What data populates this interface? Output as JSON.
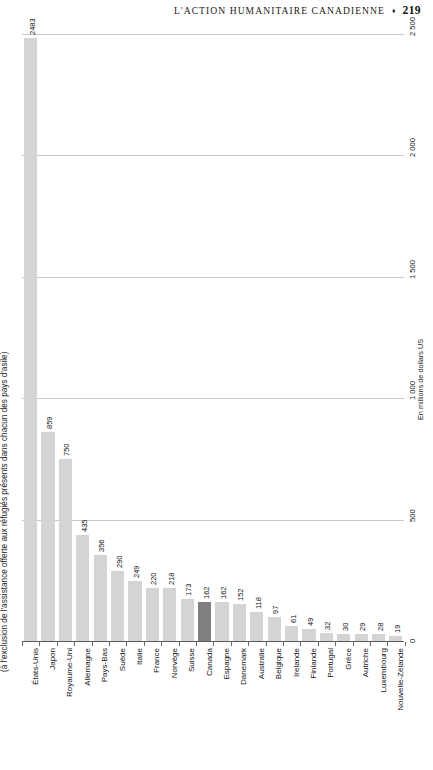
{
  "running_head": {
    "title": "L'ACTION HUMANITAIRE CANADIENNE",
    "diamond": "♦",
    "page": "219"
  },
  "chart_data": {
    "type": "bar",
    "title": "",
    "xlabel": "",
    "ylabel": "(à l'exclusion de l'assistance offerte aux réfugiés présents dans chacun des pays d'asile)",
    "unit_label": "En millions de dollars US",
    "orientation": "vertical",
    "grid": true,
    "legend": "none",
    "axis_position": "right",
    "ylim": [
      0,
      2500
    ],
    "yticks": [
      0,
      500,
      1000,
      1500,
      2000,
      2500
    ],
    "ytick_labels": [
      "0",
      "500",
      "1 000",
      "1 500",
      "2 000",
      "2 500"
    ],
    "highlight_category": "Canada",
    "colors": {
      "bar": "#d4d4d4",
      "bar_highlight": "#7f7f7f",
      "grid": "#c9c9c9",
      "axis": "#5a5a5a",
      "text": "#141414"
    },
    "categories": [
      "États-Unis",
      "Japon",
      "Royaume-Uni",
      "Allemagne",
      "Pays-Bas",
      "Suède",
      "Italie",
      "France",
      "Norvège",
      "Suisse",
      "Canada",
      "Espagne",
      "Danemark",
      "Australie",
      "Belgique",
      "Irelande",
      "Finlande",
      "Portugal",
      "Grèce",
      "Autriche",
      "Luxembourg",
      "Nouvelle-Zélande"
    ],
    "values": [
      2483,
      859,
      750,
      435,
      356,
      290,
      249,
      220,
      218,
      173,
      162,
      162,
      152,
      118,
      97,
      61,
      49,
      32,
      30,
      29,
      28,
      19
    ],
    "value_labels": [
      "2483",
      "859",
      "750",
      "435",
      "356",
      "290",
      "249",
      "220",
      "218",
      "173",
      "162",
      "162",
      "152",
      "118",
      "97",
      "61",
      "49",
      "32",
      "30",
      "29",
      "28",
      "19"
    ]
  }
}
